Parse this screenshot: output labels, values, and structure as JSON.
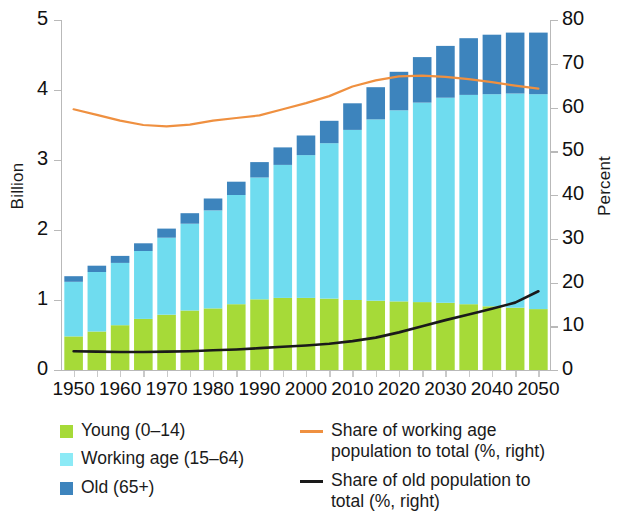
{
  "chart_data": {
    "type": "bar",
    "title": "",
    "subtitle": "",
    "xlabel": "",
    "ylabel": "Billion",
    "ylabel_right": "Percent",
    "ylim": [
      0,
      5
    ],
    "ylim_right": [
      0,
      80
    ],
    "yticks": [
      "0",
      "1",
      "2",
      "3",
      "4",
      "5"
    ],
    "yticks_right": [
      "0",
      "10",
      "20",
      "30",
      "40",
      "50",
      "60",
      "70",
      "80"
    ],
    "xticks": [
      "1950",
      "1960",
      "1970",
      "1980",
      "1990",
      "2000",
      "2010",
      "2020",
      "2030",
      "2040",
      "2050"
    ],
    "grid": false,
    "legend_position": "bottom",
    "stacked": true,
    "x": [
      1950,
      1955,
      1960,
      1965,
      1970,
      1975,
      1980,
      1985,
      1990,
      1995,
      2000,
      2005,
      2010,
      2015,
      2020,
      2025,
      2030,
      2035,
      2040,
      2045,
      2050
    ],
    "series": [
      {
        "name": "Young (0-14)",
        "color": "#a6da38",
        "axis": "left",
        "unit": "Billion",
        "values": [
          0.48,
          0.55,
          0.64,
          0.73,
          0.79,
          0.85,
          0.88,
          0.94,
          1.01,
          1.03,
          1.03,
          1.02,
          1.0,
          0.99,
          0.98,
          0.97,
          0.96,
          0.94,
          0.91,
          0.89,
          0.87
        ]
      },
      {
        "name": "Working age (15-64)",
        "color": "#6fdcef",
        "axis": "left",
        "unit": "Billion",
        "values": [
          0.78,
          0.85,
          0.89,
          0.97,
          1.1,
          1.24,
          1.4,
          1.56,
          1.74,
          1.9,
          2.04,
          2.22,
          2.43,
          2.59,
          2.73,
          2.85,
          2.93,
          2.99,
          3.03,
          3.06,
          3.07
        ]
      },
      {
        "name": "Old (65+)",
        "color": "#3d84bd",
        "axis": "left",
        "unit": "Billion",
        "values": [
          0.08,
          0.09,
          0.1,
          0.11,
          0.13,
          0.15,
          0.17,
          0.19,
          0.22,
          0.25,
          0.28,
          0.32,
          0.38,
          0.46,
          0.55,
          0.65,
          0.74,
          0.81,
          0.85,
          0.87,
          0.88
        ]
      }
    ],
    "lines": [
      {
        "name": "Share of working age population to total (%, right)",
        "color": "#ef9040",
        "axis": "right",
        "unit": "Percent",
        "values": [
          59.6,
          58.3,
          57.0,
          56.0,
          55.7,
          56.1,
          57.0,
          57.6,
          58.2,
          59.6,
          61.0,
          62.6,
          64.8,
          66.2,
          67.1,
          67.3,
          67.0,
          66.5,
          65.8,
          65.0,
          64.3
        ]
      },
      {
        "name": "Share of old population to total (%, right)",
        "color": "#1a1a1a",
        "axis": "right",
        "unit": "Percent",
        "values": [
          4.3,
          4.2,
          4.1,
          4.1,
          4.2,
          4.3,
          4.5,
          4.7,
          5.0,
          5.3,
          5.6,
          6.0,
          6.6,
          7.4,
          8.6,
          10.0,
          11.4,
          12.7,
          14.0,
          15.4,
          18.0
        ]
      }
    ],
    "legend": [
      {
        "label": "Young (0–14)",
        "type": "swatch",
        "color": "#a6da38"
      },
      {
        "label": "Working age (15–64)",
        "type": "swatch",
        "color": "#8ceaf6"
      },
      {
        "label": "Old (65+)",
        "type": "swatch",
        "color": "#3d84bd"
      },
      {
        "label": "Share of working age\npopulation to total (%, right)",
        "type": "line",
        "color": "#ef9040"
      },
      {
        "label": "Share of old population to\ntotal (%, right)",
        "type": "line",
        "color": "#1a1a1a"
      }
    ]
  }
}
